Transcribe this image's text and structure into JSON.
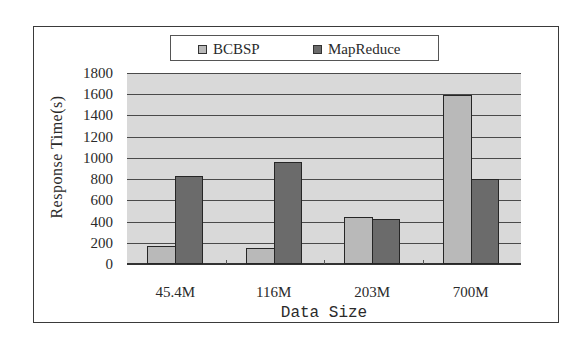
{
  "chart_data": {
    "type": "bar",
    "title": "",
    "xlabel": "Data Size",
    "ylabel": "Response Time(s)",
    "categories": [
      "45.4M",
      "116M",
      "203M",
      "700M"
    ],
    "series": [
      {
        "name": "BCBSP",
        "color": "#b9b9b9",
        "values": [
          170,
          150,
          440,
          1590
        ]
      },
      {
        "name": "MapReduce",
        "color": "#6b6b6b",
        "values": [
          830,
          960,
          420,
          800
        ]
      }
    ],
    "ylim": [
      0,
      1800
    ],
    "yticks": [
      0,
      200,
      400,
      600,
      800,
      1000,
      1200,
      1400,
      1600,
      1800
    ],
    "grid": true,
    "legend_position": "top",
    "plot_background": "#d9d9d9"
  },
  "legend": {
    "items": [
      {
        "label": "BCBSP",
        "color": "#b9b9b9"
      },
      {
        "label": "MapReduce",
        "color": "#6b6b6b"
      }
    ]
  }
}
